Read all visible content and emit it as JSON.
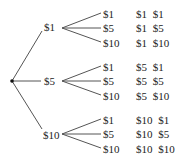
{
  "diagram": {
    "type": "tree-diagram",
    "root": {
      "x": 12,
      "y": 81
    },
    "line_color": "#555555",
    "text_color": "#222222",
    "first_level": [
      {
        "label": "$1",
        "x": 44,
        "y": 22,
        "line_end": {
          "x": 42,
          "y": 31
        },
        "branch_start": {
          "x": 62,
          "y": 28
        }
      },
      {
        "label": "$5",
        "x": 44,
        "y": 76,
        "line_end": {
          "x": 41,
          "y": 81
        },
        "branch_start": {
          "x": 62,
          "y": 81
        }
      },
      {
        "label": "$10",
        "x": 43,
        "y": 130,
        "line_end": {
          "x": 42,
          "y": 129
        },
        "branch_start": {
          "x": 62,
          "y": 134
        }
      }
    ],
    "leaves": [
      {
        "label": "$1",
        "result": "$1 $1",
        "parent": 0,
        "x": 103,
        "y": 9,
        "line_y": 13
      },
      {
        "label": "$5",
        "result": "$1 $5",
        "parent": 0,
        "x": 103,
        "y": 23,
        "line_y": 28
      },
      {
        "label": "$10",
        "result": "$1 $10",
        "parent": 0,
        "x": 103,
        "y": 38,
        "line_y": 42
      },
      {
        "label": "$1",
        "result": "$5 $1",
        "parent": 1,
        "x": 103,
        "y": 62,
        "line_y": 66
      },
      {
        "label": "$5",
        "result": "$5 $5",
        "parent": 1,
        "x": 103,
        "y": 76,
        "line_y": 81
      },
      {
        "label": "$10",
        "result": "$5 $10",
        "parent": 1,
        "x": 103,
        "y": 91,
        "line_y": 95
      },
      {
        "label": "$1",
        "result": "$10 $1",
        "parent": 2,
        "x": 103,
        "y": 115,
        "line_y": 119
      },
      {
        "label": "$5",
        "result": "$10 $5",
        "parent": 2,
        "x": 103,
        "y": 129,
        "line_y": 134
      },
      {
        "label": "$10",
        "result": "$10 $10",
        "parent": 2,
        "x": 103,
        "y": 144,
        "line_y": 148
      }
    ],
    "result_column_x": 136
  }
}
